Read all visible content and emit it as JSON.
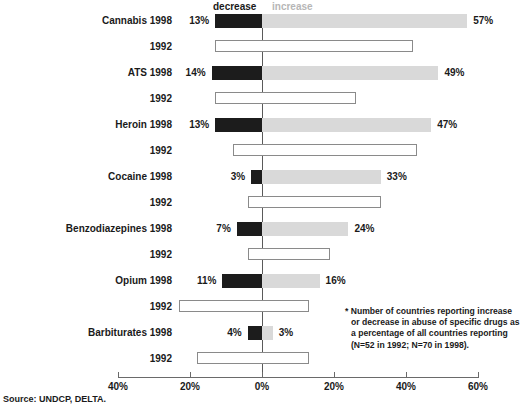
{
  "caption_fragment": "",
  "title_fragment": "",
  "legend": {
    "decrease": "decrease",
    "increase": "increase"
  },
  "source": "Source: UNDCP, DELTA.",
  "footnote": {
    "line1": "* Number of countries reporting increase",
    "line2": "or decrease in abuse of specific drugs as",
    "line3": "a percentage of all countries reporting",
    "line4": "(N=52 in 1992; N=70 in 1998)."
  },
  "axis": {
    "ticks": [
      {
        "label": "40%",
        "value": -40
      },
      {
        "label": "20%",
        "value": -20
      },
      {
        "label": "0%",
        "value": 0
      },
      {
        "label": "20%",
        "value": 20
      },
      {
        "label": "40%",
        "value": 40
      },
      {
        "label": "60%",
        "value": 60
      }
    ]
  },
  "colors": {
    "decrease": "#1c1c1c",
    "increase": "#d9d9d9",
    "hollow_border": "#8a8a8a",
    "zero_line": "#5a5a5a"
  },
  "rows": [
    {
      "label": "Cannabis 1998",
      "year": "1998",
      "drug": "Cannabis",
      "decrease": 13,
      "increase": 57,
      "decrease_label": "13%",
      "increase_label": "57%",
      "style": "filled"
    },
    {
      "label": "1992",
      "year": "1992",
      "drug": "Cannabis",
      "decrease": 13,
      "increase": 42,
      "decrease_label": "",
      "increase_label": "",
      "style": "hollow"
    },
    {
      "label": "ATS 1998",
      "year": "1998",
      "drug": "ATS",
      "decrease": 14,
      "increase": 49,
      "decrease_label": "14%",
      "increase_label": "49%",
      "style": "filled"
    },
    {
      "label": "1992",
      "year": "1992",
      "drug": "ATS",
      "decrease": 13,
      "increase": 26,
      "decrease_label": "",
      "increase_label": "",
      "style": "hollow"
    },
    {
      "label": "Heroin 1998",
      "year": "1998",
      "drug": "Heroin",
      "decrease": 13,
      "increase": 47,
      "decrease_label": "13%",
      "increase_label": "47%",
      "style": "filled"
    },
    {
      "label": "1992",
      "year": "1992",
      "drug": "Heroin",
      "decrease": 8,
      "increase": 43,
      "decrease_label": "",
      "increase_label": "",
      "style": "hollow"
    },
    {
      "label": "Cocaine 1998",
      "year": "1998",
      "drug": "Cocaine",
      "decrease": 3,
      "increase": 33,
      "decrease_label": "3%",
      "increase_label": "33%",
      "style": "filled"
    },
    {
      "label": "1992",
      "year": "1992",
      "drug": "Cocaine",
      "decrease": 4,
      "increase": 33,
      "decrease_label": "",
      "increase_label": "",
      "style": "hollow"
    },
    {
      "label": "Benzodiazepines 1998",
      "year": "1998",
      "drug": "Benzodiazepines",
      "decrease": 7,
      "increase": 24,
      "decrease_label": "7%",
      "increase_label": "24%",
      "style": "filled"
    },
    {
      "label": "1992",
      "year": "1992",
      "drug": "Benzodiazepines",
      "decrease": 4,
      "increase": 19,
      "decrease_label": "",
      "increase_label": "",
      "style": "hollow"
    },
    {
      "label": "Opium 1998",
      "year": "1998",
      "drug": "Opium",
      "decrease": 11,
      "increase": 16,
      "decrease_label": "11%",
      "increase_label": "16%",
      "style": "filled"
    },
    {
      "label": "1992",
      "year": "1992",
      "drug": "Opium",
      "decrease": 23,
      "increase": 13,
      "decrease_label": "",
      "increase_label": "",
      "style": "hollow"
    },
    {
      "label": "Barbiturates 1998",
      "year": "1998",
      "drug": "Barbiturates",
      "decrease": 4,
      "increase": 3,
      "decrease_label": "4%",
      "increase_label": "3%",
      "style": "filled"
    },
    {
      "label": "1992",
      "year": "1992",
      "drug": "Barbiturates",
      "decrease": 18,
      "increase": 13,
      "decrease_label": "",
      "increase_label": "",
      "style": "hollow"
    }
  ],
  "chart_data": {
    "type": "bar",
    "orientation": "horizontal",
    "subtype": "diverging-bidirectional",
    "xlabel": "",
    "ylabel": "",
    "xlim": [
      -45,
      62
    ],
    "grid": false,
    "legend_position": "top-center",
    "legend_entries": [
      "decrease",
      "increase"
    ],
    "categories": [
      "Cannabis 1998",
      "Cannabis 1992",
      "ATS 1998",
      "ATS 1992",
      "Heroin 1998",
      "Heroin 1992",
      "Cocaine 1998",
      "Cocaine 1992",
      "Benzodiazepines 1998",
      "Benzodiazepines 1992",
      "Opium 1998",
      "Opium 1992",
      "Barbiturates 1998",
      "Barbiturates 1992"
    ],
    "series": [
      {
        "name": "decrease",
        "values": [
          13,
          13,
          14,
          13,
          13,
          8,
          3,
          4,
          7,
          4,
          11,
          23,
          4,
          18
        ]
      },
      {
        "name": "increase",
        "values": [
          57,
          42,
          49,
          26,
          47,
          43,
          33,
          33,
          24,
          19,
          16,
          13,
          3,
          13
        ]
      }
    ],
    "labeled_values_1998": {
      "Cannabis": {
        "decrease": "13%",
        "increase": "57%"
      },
      "ATS": {
        "decrease": "14%",
        "increase": "49%"
      },
      "Heroin": {
        "decrease": "13%",
        "increase": "47%"
      },
      "Cocaine": {
        "decrease": "3%",
        "increase": "33%"
      },
      "Benzodiazepines": {
        "decrease": "7%",
        "increase": "24%"
      },
      "Opium": {
        "decrease": "11%",
        "increase": "16%"
      },
      "Barbiturates": {
        "decrease": "4%",
        "increase": "3%"
      }
    },
    "xticks": [
      -40,
      -20,
      0,
      20,
      40,
      60
    ],
    "xticklabels": [
      "40%",
      "20%",
      "0%",
      "20%",
      "40%",
      "60%"
    ],
    "annotations": [
      "* Number of countries reporting increase or decrease in abuse of specific drugs as a percentage of all countries reporting (N=52 in 1992; N=70 in 1998).",
      "Source: UNDCP, DELTA."
    ]
  }
}
